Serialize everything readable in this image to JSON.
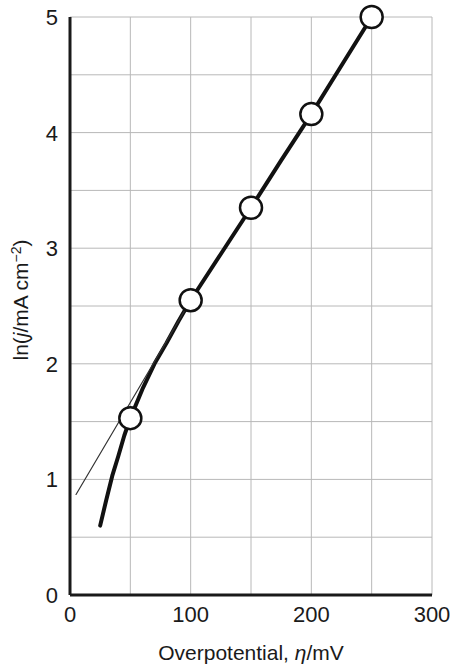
{
  "chart_data": {
    "type": "line",
    "title": "",
    "xlabel": "Overpotential, η/mV",
    "ylabel": "ln(j/mA cm⁻²)",
    "xlabel_parts": {
      "prefix": "Overpotential, ",
      "symbol": "η",
      "suffix": "/mV"
    },
    "ylabel_parts": {
      "prefix": "ln(",
      "symbol": "j",
      "mid": "/mA cm",
      "sup": "−2",
      "suffix": ")"
    },
    "xlim": [
      0,
      300
    ],
    "ylim": [
      0,
      5
    ],
    "xticks": [
      0,
      100,
      200,
      300
    ],
    "xtick_labels": [
      "0",
      "100",
      "200",
      "300"
    ],
    "yticks": [
      0,
      1,
      2,
      3,
      4,
      5
    ],
    "ytick_labels": [
      "0",
      "1",
      "2",
      "3",
      "4",
      "5"
    ],
    "x_gridlines": [
      0,
      50,
      100,
      150,
      200,
      250,
      300
    ],
    "y_gridlines": [
      0,
      0.5,
      1,
      1.5,
      2,
      2.5,
      3,
      3.5,
      4,
      4.5,
      5
    ],
    "grid": true,
    "legend": "none",
    "series": [
      {
        "name": "Butler-Volmer curve",
        "style": "thick-curve",
        "color": "#111111",
        "linewidth": 4,
        "points": [
          {
            "x": 25,
            "y": 0.6
          },
          {
            "x": 30,
            "y": 0.82
          },
          {
            "x": 35,
            "y": 1.03
          },
          {
            "x": 40,
            "y": 1.2
          },
          {
            "x": 45,
            "y": 1.38
          },
          {
            "x": 50,
            "y": 1.53
          },
          {
            "x": 60,
            "y": 1.78
          },
          {
            "x": 70,
            "y": 2.0
          },
          {
            "x": 80,
            "y": 2.18
          },
          {
            "x": 90,
            "y": 2.37
          },
          {
            "x": 100,
            "y": 2.55
          },
          {
            "x": 125,
            "y": 2.95
          },
          {
            "x": 150,
            "y": 3.35
          },
          {
            "x": 175,
            "y": 3.76
          },
          {
            "x": 200,
            "y": 4.16
          },
          {
            "x": 225,
            "y": 4.58
          },
          {
            "x": 250,
            "y": 5.0
          }
        ]
      },
      {
        "name": "Tafel tangent",
        "style": "thin-line",
        "color": "#333333",
        "linewidth": 1.2,
        "points": [
          {
            "x": 5,
            "y": 0.87
          },
          {
            "x": 100,
            "y": 2.55
          }
        ]
      }
    ],
    "markers": {
      "shape": "open-circle",
      "radius": 11,
      "fill": "#ffffff",
      "stroke": "#111111",
      "points": [
        {
          "x": 50,
          "y": 1.53
        },
        {
          "x": 100,
          "y": 2.55
        },
        {
          "x": 150,
          "y": 3.35
        },
        {
          "x": 200,
          "y": 4.16
        },
        {
          "x": 250,
          "y": 5.0
        }
      ]
    },
    "colors": {
      "grid": "#b8b8b8",
      "axis": "#1a1a1a",
      "data": "#111111",
      "background": "#ffffff"
    }
  }
}
